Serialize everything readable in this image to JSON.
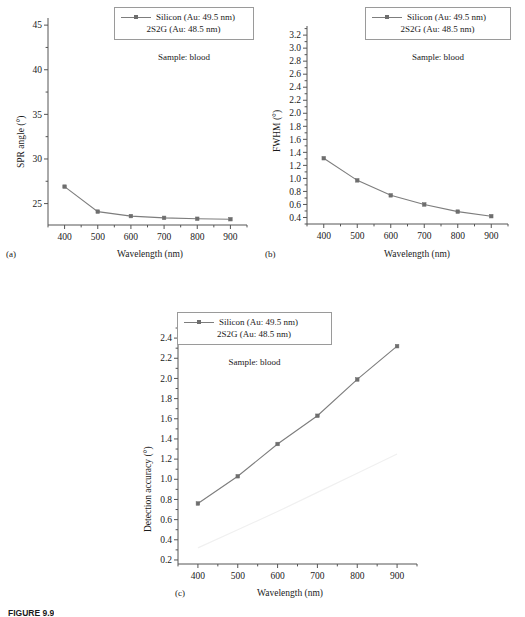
{
  "figure": {
    "caption": "FIGURE 9.9",
    "sample_note": "Sample: blood",
    "legend": {
      "series1": "Silicon (Au: 49.5 nm)",
      "series2": "2S2G (Au: 48.5 nm)"
    },
    "xlabel": "Wavelength (nm)",
    "panel_tags": {
      "a": "(a)",
      "b": "(b)",
      "c": "(c)"
    },
    "colors": {
      "series1_line": "#7d7d7d",
      "series1_marker": "#6e6e6e",
      "series2_line": "#f0f0f0",
      "axis": "#555555",
      "text": "#1a1a1a"
    }
  },
  "chart_data": [
    {
      "type": "line",
      "panel": "(a)",
      "title": "",
      "xlabel": "Wavelength (nm)",
      "ylabel": "SPR angle (°)",
      "x": [
        400,
        500,
        600,
        700,
        800,
        900
      ],
      "xlim": [
        350,
        950
      ],
      "xticks": [
        400,
        500,
        600,
        700,
        800,
        900
      ],
      "xtick_labels": [
        "400",
        "500",
        "600",
        "700",
        "800",
        "900"
      ],
      "ylim": [
        22.6,
        45.8
      ],
      "yticks": [
        25,
        30,
        35,
        40,
        45
      ],
      "ytick_labels": [
        "25",
        "30",
        "35",
        "40",
        "45"
      ],
      "minor_ticks": true,
      "grid": false,
      "legend_position": "top-right-outside",
      "annotations": [
        "Sample: blood"
      ],
      "series": [
        {
          "name": "Silicon (Au: 49.5 nm)",
          "values": [
            26.9,
            24.1,
            23.6,
            23.4,
            23.3,
            23.25
          ],
          "visible": true
        },
        {
          "name": "2S2G (Au: 48.5 nm)",
          "values": [
            null,
            null,
            null,
            null,
            null,
            null
          ],
          "visible": false
        }
      ]
    },
    {
      "type": "line",
      "panel": "(b)",
      "title": "",
      "xlabel": "Wavelength (nm)",
      "ylabel": "FWHM (°)",
      "x": [
        400,
        500,
        600,
        700,
        800,
        900
      ],
      "xlim": [
        350,
        950
      ],
      "xticks": [
        400,
        500,
        600,
        700,
        800,
        900
      ],
      "xtick_labels": [
        "400",
        "500",
        "600",
        "700",
        "800",
        "900"
      ],
      "ylim": [
        0.3,
        3.34
      ],
      "yticks": [
        0.4,
        0.6,
        0.8,
        1.0,
        1.2,
        1.4,
        1.6,
        1.8,
        2.0,
        2.2,
        2.4,
        2.6,
        2.8,
        3.0,
        3.2
      ],
      "ytick_labels": [
        "0.4",
        "0.6",
        "0.8",
        "1.0",
        "1.2",
        "1.4",
        "1.6",
        "1.8",
        "2.0",
        "2.2",
        "2.4",
        "2.6",
        "2.8",
        "3.0",
        "3.2"
      ],
      "minor_ticks": true,
      "grid": false,
      "legend_position": "top-right-outside",
      "annotations": [
        "Sample: blood"
      ],
      "series": [
        {
          "name": "Silicon (Au: 49.5 nm)",
          "values": [
            1.31,
            0.97,
            0.74,
            0.6,
            0.49,
            0.42
          ],
          "visible": true
        },
        {
          "name": "2S2G (Au: 48.5 nm)",
          "values": [
            null,
            null,
            null,
            null,
            null,
            null
          ],
          "visible": false
        }
      ]
    },
    {
      "type": "line",
      "panel": "(c)",
      "title": "",
      "xlabel": "Wavelength (nm)",
      "ylabel": "Detection accuracy (°)",
      "x": [
        400,
        500,
        600,
        700,
        800,
        900
      ],
      "xlim": [
        350,
        950
      ],
      "xticks": [
        400,
        500,
        600,
        700,
        800,
        900
      ],
      "xtick_labels": [
        "400",
        "500",
        "600",
        "700",
        "800",
        "900"
      ],
      "ylim": [
        0.16,
        2.52
      ],
      "yticks": [
        0.2,
        0.4,
        0.6,
        0.8,
        1.0,
        1.2,
        1.4,
        1.6,
        1.8,
        2.0,
        2.2,
        2.4
      ],
      "ytick_labels": [
        "0.2",
        "0.4",
        "0.6",
        "0.8",
        "1.0",
        "1.2",
        "1.4",
        "1.6",
        "1.8",
        "2.0",
        "2.2",
        "2.4"
      ],
      "minor_ticks": true,
      "grid": false,
      "legend_position": "top-center-outside",
      "annotations": [
        "Sample: blood"
      ],
      "series": [
        {
          "name": "Silicon (Au: 49.5 nm)",
          "values": [
            0.76,
            1.03,
            1.35,
            1.63,
            1.99,
            2.32
          ],
          "visible": true
        },
        {
          "name": "2S2G (Au: 48.5 nm)",
          "values": [
            0.32,
            0.5,
            0.68,
            0.87,
            1.06,
            1.25
          ],
          "visible": true
        }
      ]
    }
  ]
}
